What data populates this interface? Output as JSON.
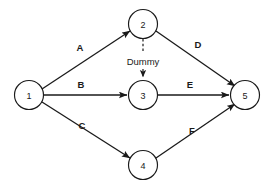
{
  "diagram": {
    "type": "activity-on-arrow-network",
    "title": "",
    "background_color": "#ffffff",
    "stroke_color": "#1a1a1a",
    "nodes": [
      {
        "id": "1",
        "label": "1",
        "cx": 29,
        "cy": 95,
        "r": 14.5
      },
      {
        "id": "2",
        "label": "2",
        "cx": 143,
        "cy": 24,
        "r": 14.5
      },
      {
        "id": "3",
        "label": "3",
        "cx": 143,
        "cy": 95,
        "r": 14.5
      },
      {
        "id": "4",
        "label": "4",
        "cx": 143,
        "cy": 165,
        "r": 14.5
      },
      {
        "id": "5",
        "label": "5",
        "cx": 245,
        "cy": 95,
        "r": 14.5
      }
    ],
    "edges": [
      {
        "id": "A",
        "label": "A",
        "from": "1",
        "to": "2",
        "style": "solid",
        "x1": 42,
        "y1": 89,
        "x2": 130,
        "y2": 31,
        "label_x": 80,
        "label_y": 47
      },
      {
        "id": "B",
        "label": "B",
        "from": "1",
        "to": "3",
        "style": "solid",
        "x1": 44,
        "y1": 95,
        "x2": 127,
        "y2": 95,
        "label_x": 81,
        "label_y": 84
      },
      {
        "id": "C",
        "label": "C",
        "from": "1",
        "to": "4",
        "style": "solid",
        "x1": 42,
        "y1": 102,
        "x2": 130,
        "y2": 158,
        "label_x": 82,
        "label_y": 125
      },
      {
        "id": "D",
        "label": "D",
        "from": "2",
        "to": "5",
        "style": "solid",
        "x1": 156,
        "y1": 31,
        "x2": 235,
        "y2": 86,
        "label_x": 198,
        "label_y": 44
      },
      {
        "id": "E",
        "label": "E",
        "from": "3",
        "to": "5",
        "style": "solid",
        "x1": 158,
        "y1": 95,
        "x2": 229,
        "y2": 95,
        "label_x": 190,
        "label_y": 84
      },
      {
        "id": "F",
        "label": "F",
        "from": "4",
        "to": "5",
        "style": "solid",
        "x1": 156,
        "y1": 158,
        "x2": 235,
        "y2": 104,
        "label_x": 192,
        "label_y": 130
      },
      {
        "id": "Dummy",
        "label": "Dummy",
        "from": "2",
        "to": "3",
        "style": "dashed",
        "x1": 143,
        "y1": 39,
        "x2": 143,
        "y2": 79,
        "label_x": 143,
        "label_y": 61
      }
    ]
  }
}
